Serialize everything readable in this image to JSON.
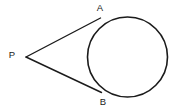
{
  "figure": {
    "background_color": "#ffffff",
    "stroke_color": "#1b1b1b",
    "label_color": "#1a1a1a",
    "width": 187,
    "height": 112
  },
  "labels": {
    "external_point": "P",
    "tangent_point_upper": "A",
    "tangent_point_lower": "B"
  },
  "chart_data": {
    "type": "diagram",
    "shapes": [
      {
        "name": "circle",
        "kind": "circle",
        "cx": 127.5,
        "cy": 57,
        "r": 40,
        "stroke": "#1b1b1b",
        "stroke_width": 1.6,
        "fill": "none"
      },
      {
        "name": "tangent-line-upper",
        "kind": "line",
        "from": [
          26,
          57
        ],
        "to": [
          100.5,
          18
        ],
        "stroke": "#1b1b1b",
        "stroke_width": 1.4
      },
      {
        "name": "tangent-line-lower",
        "kind": "line",
        "from": [
          26,
          57
        ],
        "to": [
          101.5,
          92.5
        ],
        "stroke": "#1b1b1b",
        "stroke_width": 1.4
      }
    ],
    "points": [
      {
        "name": "P",
        "x": 26,
        "y": 57,
        "label": "P",
        "label_x": 12,
        "label_y": 55
      },
      {
        "name": "A",
        "x": 100.5,
        "y": 18,
        "label": "A",
        "label_x": 100,
        "label_y": 8
      },
      {
        "name": "B",
        "x": 101.5,
        "y": 92.5,
        "label": "B",
        "label_x": 103,
        "label_y": 102
      }
    ],
    "grid": false,
    "legend": null,
    "xlabel": "",
    "ylabel": ""
  }
}
